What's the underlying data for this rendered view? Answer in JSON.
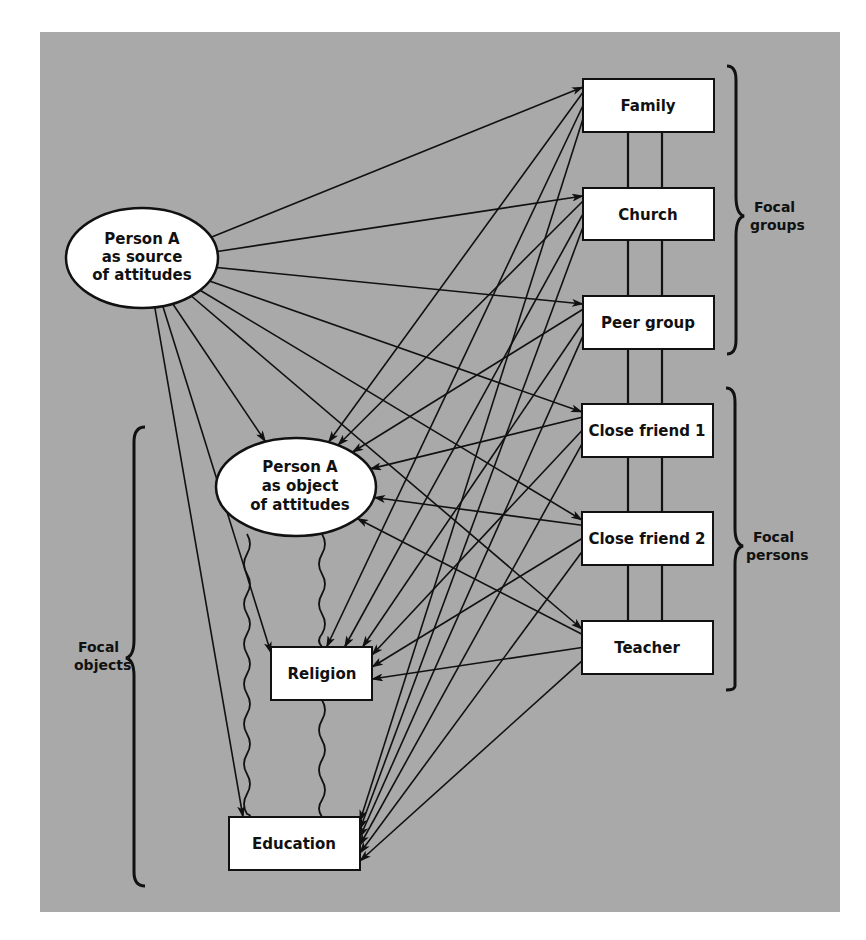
{
  "diagram": {
    "type": "attitude network diagram",
    "background_color": "#a9a9a9",
    "node_fill": "#ffffff",
    "line_color": "#111111",
    "source_node": {
      "id": "source",
      "lines": [
        "Person A",
        "as source",
        "of attitudes"
      ],
      "shape": "ellipse"
    },
    "object_node": {
      "id": "object",
      "lines": [
        "Person A",
        "as object",
        "of attitudes"
      ],
      "shape": "ellipse"
    },
    "objects": [
      {
        "id": "religion",
        "label": "Religion"
      },
      {
        "id": "education",
        "label": "Education"
      }
    ],
    "groups": [
      {
        "id": "family",
        "label": "Family"
      },
      {
        "id": "church",
        "label": "Church"
      },
      {
        "id": "peer",
        "label": "Peer group"
      }
    ],
    "persons": [
      {
        "id": "friend1",
        "label": "Close friend 1"
      },
      {
        "id": "friend2",
        "label": "Close friend 2"
      },
      {
        "id": "teacher",
        "label": "Teacher"
      }
    ],
    "brackets": {
      "focal_groups": [
        "Focal",
        "groups"
      ],
      "focal_persons": [
        "Focal",
        "persons"
      ],
      "focal_objects": [
        "Focal",
        "objects"
      ]
    },
    "edges_from_source": [
      "family",
      "church",
      "peer",
      "friend1",
      "friend2",
      "teacher",
      "object",
      "religion",
      "education"
    ],
    "edges_from_referents": {
      "targets": [
        "object",
        "religion",
        "education"
      ],
      "referents": [
        "family",
        "church",
        "peer",
        "friend1",
        "friend2",
        "teacher"
      ]
    },
    "wavy_links": [
      "object-religion",
      "religion-education"
    ]
  }
}
